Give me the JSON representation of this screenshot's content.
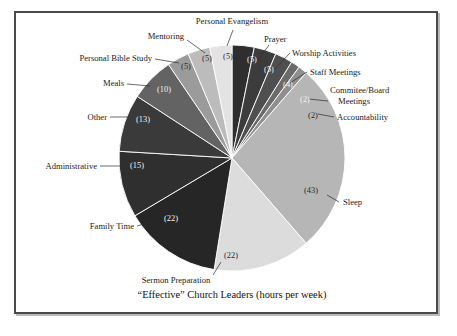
{
  "figure": {
    "caption": "“Effective” Church Leaders (hours per week)",
    "background": "#ffffff",
    "frame_color": "#4a4a4a"
  },
  "chart_data": {
    "type": "pie",
    "title": "“Effective” Church Leaders (hours per week)",
    "unit": "hours per week",
    "total": 158,
    "start_angle_deg": 0,
    "direction": "clockwise",
    "legend": "none",
    "value_label_format": "(n)",
    "categories": [
      "Prayer",
      "Worship Activities",
      "Staff Meetings",
      "Commitee/Board Meetings",
      "Accountability",
      "Sleep",
      "Sermon Preparation",
      "Family Time",
      "Administrative",
      "Other",
      "Meals",
      "Personal Bible Study",
      "Mentoring",
      "Personal Evangelism"
    ],
    "values": [
      5,
      5,
      4,
      2,
      2,
      43,
      22,
      22,
      15,
      13,
      10,
      5,
      5,
      5
    ],
    "colors": [
      "#2e2e2e",
      "#3c3c3c",
      "#4f4f4f",
      "#6b6b6b",
      "#8f8f8f",
      "#b6b6b6",
      "#dcdcdc",
      "#262626",
      "#2f2f2f",
      "#3a3a3a",
      "#636363",
      "#9b9b9b",
      "#bcbcbc",
      "#e3e3e3"
    ],
    "slices": [
      {
        "label": "Prayer",
        "value": 5,
        "value_text": "(5)",
        "color": "#2e2e2e",
        "value_text_color": "light"
      },
      {
        "label": "Worship Activities",
        "value": 5,
        "value_text": "(5)",
        "color": "#3c3c3c",
        "value_text_color": "light"
      },
      {
        "label": "Staff Meetings",
        "value": 4,
        "value_text": "(4)",
        "color": "#4f4f4f",
        "value_text_color": "light"
      },
      {
        "label": "Commitee/Board Meetings",
        "value": 2,
        "value_text": "(2)",
        "color": "#6b6b6b",
        "value_text_color": "light"
      },
      {
        "label": "Accountability",
        "value": 2,
        "value_text": "(2)",
        "color": "#8f8f8f",
        "value_text_color": "dark"
      },
      {
        "label": "Sleep",
        "value": 43,
        "value_text": "(43)",
        "color": "#b6b6b6",
        "value_text_color": "dark"
      },
      {
        "label": "Sermon Preparation",
        "value": 22,
        "value_text": "(22)",
        "color": "#dcdcdc",
        "value_text_color": "dark"
      },
      {
        "label": "Family Time",
        "value": 22,
        "value_text": "(22)",
        "color": "#262626",
        "value_text_color": "light"
      },
      {
        "label": "Administrative",
        "value": 15,
        "value_text": "(15)",
        "color": "#2f2f2f",
        "value_text_color": "light"
      },
      {
        "label": "Other",
        "value": 13,
        "value_text": "(13)",
        "color": "#3a3a3a",
        "value_text_color": "light"
      },
      {
        "label": "Meals",
        "value": 10,
        "value_text": "(10)",
        "color": "#636363",
        "value_text_color": "light"
      },
      {
        "label": "Personal Bible Study",
        "value": 5,
        "value_text": "(5)",
        "color": "#9b9b9b",
        "value_text_color": "dark"
      },
      {
        "label": "Mentoring",
        "value": 5,
        "value_text": "(5)",
        "color": "#bcbcbc",
        "value_text_color": "dark"
      },
      {
        "label": "Personal Evangelism",
        "value": 5,
        "value_text": "(5)",
        "color": "#e3e3e3",
        "value_text_color": "dark"
      }
    ]
  },
  "labels": {
    "personal_evangelism": "Personal Evangelism",
    "mentoring": "Mentoring",
    "personal_bible_study": "Personal Bible Study",
    "meals": "Meals",
    "other": "Other",
    "administrative": "Administrative",
    "family_time": "Family Time",
    "sermon_preparation": "Sermon Preparation",
    "sleep": "Sleep",
    "accountability": "Accountability",
    "committee_board_line1": "Commitee/Board",
    "committee_board_line2": "Meetings",
    "staff_meetings": "Staff Meetings",
    "worship_activities": "Worship Activities",
    "prayer": "Prayer"
  },
  "values_text": {
    "personal_evangelism": "(5)",
    "mentoring": "(5)",
    "personal_bible_study": "(5)",
    "meals": "(10)",
    "other": "(13)",
    "administrative": "(15)",
    "family_time": "(22)",
    "sermon_preparation": "(22)",
    "sleep": "(43)",
    "accountability": "(2)",
    "committee_board": "(2)",
    "staff_meetings": "(4)",
    "worship_activities": "(5)",
    "prayer": "(5)"
  }
}
